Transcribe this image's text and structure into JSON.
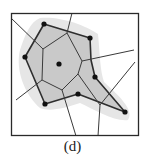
{
  "figure": {
    "caption": "(d)",
    "colors": {
      "frame": "#2a2a2a",
      "hull_fill": "#c8c8c8",
      "halo": "#e4e4e4",
      "edges": "#333333",
      "points": "#111111"
    },
    "frame": {
      "x1": 11,
      "y1": 13,
      "x2": 139,
      "y2": 136
    },
    "points": [
      {
        "x": 44,
        "y": 24
      },
      {
        "x": 90,
        "y": 38
      },
      {
        "x": 25,
        "y": 57
      },
      {
        "x": 59,
        "y": 64
      },
      {
        "x": 95,
        "y": 77
      },
      {
        "x": 78,
        "y": 94
      },
      {
        "x": 45,
        "y": 104
      },
      {
        "x": 125,
        "y": 112
      }
    ],
    "hull": [
      [
        44,
        24
      ],
      [
        90,
        38
      ],
      [
        91,
        60
      ],
      [
        95,
        77
      ],
      [
        125,
        112
      ],
      [
        78,
        94
      ],
      [
        45,
        104
      ],
      [
        25,
        57
      ]
    ],
    "voronoi_edges": [
      [
        [
          67,
          33
        ],
        [
          43,
          49
        ]
      ],
      [
        [
          67,
          33
        ],
        [
          82,
          61
        ]
      ],
      [
        [
          43,
          49
        ],
        [
          42,
          80
        ]
      ],
      [
        [
          42,
          80
        ],
        [
          62,
          90
        ]
      ],
      [
        [
          62,
          90
        ],
        [
          78,
          74
        ]
      ],
      [
        [
          78,
          74
        ],
        [
          82,
          61
        ]
      ],
      [
        [
          67,
          33
        ],
        [
          72,
          13
        ]
      ],
      [
        [
          43,
          49
        ],
        [
          11,
          18
        ]
      ],
      [
        [
          42,
          80
        ],
        [
          16,
          100
        ]
      ],
      [
        [
          62,
          90
        ],
        [
          76,
          136
        ]
      ],
      [
        [
          82,
          61
        ],
        [
          134,
          50
        ]
      ],
      [
        [
          78,
          74
        ],
        [
          100,
          105
        ]
      ],
      [
        [
          100,
          105
        ],
        [
          98,
          136
        ]
      ],
      [
        [
          100,
          105
        ],
        [
          135,
          62
        ]
      ]
    ]
  }
}
